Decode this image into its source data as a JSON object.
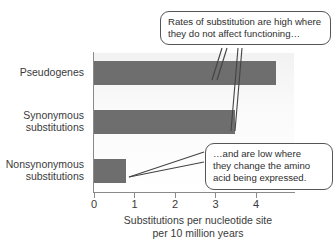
{
  "chart_data": {
    "type": "bar",
    "orientation": "horizontal",
    "title": "",
    "subtitle": "",
    "categories": [
      "Pseudogenes",
      "Synonymous substitutions",
      "Nonsynonymous substitutions"
    ],
    "values": [
      4.5,
      3.5,
      0.8
    ],
    "series": [
      {
        "name": "Substitution rate",
        "values": [
          4.5,
          3.5,
          0.8
        ]
      }
    ],
    "xlabel": "Substitutions per nucleotide site per 10 million years",
    "ylabel": "",
    "xlim": [
      0,
      4.95
    ],
    "xticks": [
      0,
      1,
      2,
      3,
      4
    ],
    "xtick_labels": [
      "0",
      "1",
      "2",
      "3",
      "4"
    ],
    "grid": false,
    "legend": false,
    "bar_color": "#6e6e6e",
    "axis_color": "#8a8a8a",
    "plot_background": "#f6f6f6",
    "annotations": [
      {
        "id": "callout-high",
        "text": "Rates of substitution are high where they do not affect functioning…",
        "points_to": [
          "Pseudogenes",
          "Synonymous substitutions"
        ]
      },
      {
        "id": "callout-low",
        "text": "…and are low where they change the amino acid being expressed.",
        "points_to": [
          "Nonsynonymous substitutions"
        ]
      }
    ]
  },
  "axis": {
    "x_title_line1": "Substitutions per nucleotide site",
    "x_title_line2": "per 10 million years",
    "tick_labels": [
      "0",
      "1",
      "2",
      "3",
      "4"
    ]
  },
  "categories": {
    "pseudogenes": "Pseudogenes",
    "synonymous_line1": "Synonymous",
    "synonymous_line2": "substitutions",
    "nonsynonymous_line1": "Nonsynonymous",
    "nonsynonymous_line2": "substitutions"
  },
  "callouts": {
    "high": {
      "line1": "Rates of substitution are high where",
      "line2": "they do not affect functioning…"
    },
    "low": {
      "line1": "…and are low where",
      "line2": "they change the amino",
      "line3": "acid being expressed."
    }
  }
}
